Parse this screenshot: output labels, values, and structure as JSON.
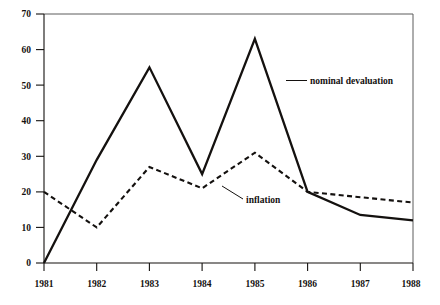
{
  "chart_data": {
    "type": "line",
    "title": "",
    "subtitle": "",
    "xlabel": "",
    "ylabel": "",
    "x": [
      1981,
      1982,
      1983,
      1984,
      1985,
      1986,
      1987,
      1988
    ],
    "categories": [
      "1981",
      "1982",
      "1983",
      "1984",
      "1985",
      "1986",
      "1987",
      "1988"
    ],
    "xlim": [
      1981,
      1988
    ],
    "ylim": [
      0,
      70
    ],
    "yticks": [
      0,
      10,
      20,
      30,
      40,
      50,
      60,
      70
    ],
    "ytick_labels": [
      "0",
      "10",
      "20",
      "30",
      "40",
      "50",
      "60",
      "70"
    ],
    "xticks": [
      1981,
      1982,
      1983,
      1984,
      1985,
      1986,
      1987,
      1988
    ],
    "xtick_labels": [
      "1981",
      "1982",
      "1983",
      "1984",
      "1985",
      "1986",
      "1987",
      "1988"
    ],
    "grid": false,
    "legend_position": "inline-annotations",
    "series": [
      {
        "name": "nominal devaluation",
        "style": "solid",
        "color": "#14110f",
        "values": [
          0,
          29,
          55,
          25,
          63,
          20,
          13.5,
          12
        ]
      },
      {
        "name": "inflation",
        "style": "dashed",
        "color": "#14110f",
        "values": [
          20,
          10,
          27,
          21,
          31,
          20,
          18.5,
          17
        ]
      }
    ],
    "annotations": [
      {
        "text": "nominal devaluation",
        "target_series": "nominal devaluation"
      },
      {
        "text": "inflation",
        "target_series": "inflation"
      }
    ]
  },
  "axes": {
    "y_tick_0": "0",
    "y_tick_1": "10",
    "y_tick_2": "20",
    "y_tick_3": "30",
    "y_tick_4": "40",
    "y_tick_5": "50",
    "y_tick_6": "60",
    "y_tick_7": "70",
    "x_tick_0": "1981",
    "x_tick_1": "1982",
    "x_tick_2": "1983",
    "x_tick_3": "1984",
    "x_tick_4": "1985",
    "x_tick_5": "1986",
    "x_tick_6": "1987",
    "x_tick_7": "1988"
  },
  "labels": {
    "nominal_devaluation": "nominal devaluation",
    "inflation": "inflation"
  }
}
